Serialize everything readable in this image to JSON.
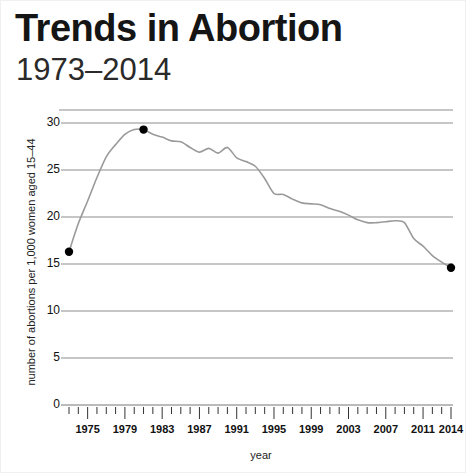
{
  "header": {
    "title": "Trends in Abortion",
    "subtitle": "1973–2014"
  },
  "chart_data": {
    "type": "line",
    "title": "Trends in Abortion",
    "subtitle": "1973–2014",
    "xlabel": "year",
    "ylabel": "number of abortions per 1,000 women aged 15–44",
    "xlim": [
      1973,
      2014
    ],
    "ylim": [
      0,
      32
    ],
    "grid": true,
    "legend": null,
    "line_color": "#9a9a9a",
    "marker_color": "#000000",
    "ytick_labels": [
      "0",
      "5",
      "10",
      "15",
      "20",
      "25",
      "30"
    ],
    "yticks": [
      0,
      5,
      10,
      15,
      20,
      25,
      30
    ],
    "xtick_labels": [
      "1975",
      "1979",
      "1983",
      "1987",
      "1991",
      "1995",
      "1999",
      "2003",
      "2007",
      "2011",
      "2014"
    ],
    "xticks": [
      1975,
      1979,
      1983,
      1987,
      1991,
      1995,
      1999,
      2003,
      2007,
      2011,
      2014
    ],
    "x": [
      1973,
      1974,
      1975,
      1976,
      1977,
      1978,
      1979,
      1980,
      1981,
      1982,
      1983,
      1984,
      1985,
      1986,
      1987,
      1988,
      1989,
      1990,
      1991,
      1992,
      1993,
      1994,
      1995,
      1996,
      1997,
      1998,
      1999,
      2000,
      2001,
      2002,
      2003,
      2004,
      2005,
      2006,
      2007,
      2008,
      2009,
      2010,
      2011,
      2012,
      2013,
      2014
    ],
    "values": [
      16.3,
      19.3,
      21.7,
      24.2,
      26.4,
      27.7,
      28.8,
      29.3,
      29.3,
      28.8,
      28.5,
      28.1,
      28.0,
      27.4,
      26.9,
      27.3,
      26.8,
      27.4,
      26.3,
      25.9,
      25.4,
      24.1,
      22.5,
      22.4,
      21.9,
      21.5,
      21.4,
      21.3,
      20.9,
      20.6,
      20.2,
      19.7,
      19.4,
      19.4,
      19.5,
      19.6,
      19.4,
      17.7,
      16.9,
      15.9,
      15.2,
      14.6
    ],
    "markers": [
      {
        "x": 1973,
        "y": 16.3,
        "label": "start"
      },
      {
        "x": 1981,
        "y": 29.3,
        "label": "peak"
      },
      {
        "x": 2014,
        "y": 14.6,
        "label": "end"
      }
    ],
    "annotations": []
  }
}
